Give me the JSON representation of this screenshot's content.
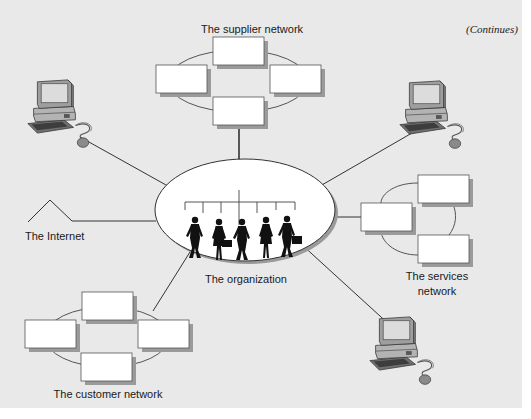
{
  "figure": {
    "continues_note": "(Continues)",
    "colors": {
      "background": "#e9e9e9",
      "box_fill": "#ffffff",
      "box_shadow": "#9a9a9a",
      "line": "#333333"
    }
  },
  "nodes": {
    "supplier_network": {
      "label": "The supplier network",
      "box_count": 4
    },
    "organization": {
      "label": "The organization",
      "icon": "people-org-chart-icon"
    },
    "services_network": {
      "label_line1": "The services",
      "label_line2": "network",
      "box_count": 3
    },
    "customer_network": {
      "label": "The customer network",
      "box_count": 4
    },
    "internet": {
      "label": "The Internet",
      "icon": "zigzag-line-icon"
    },
    "computers": [
      {
        "position": "top-left",
        "icon": "desktop-computer-icon"
      },
      {
        "position": "top-right",
        "icon": "desktop-computer-icon"
      },
      {
        "position": "bottom-right",
        "icon": "desktop-computer-icon"
      }
    ]
  }
}
